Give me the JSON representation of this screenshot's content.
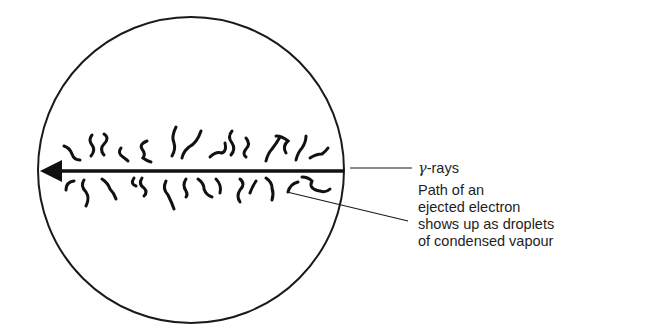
{
  "diagram": {
    "labels": {
      "gamma_symbol": "γ",
      "gamma_text": "-rays",
      "electron_lines": [
        "Path of an",
        "ejected electron",
        "shows up as droplets",
        "of condensed vapour"
      ]
    },
    "elements": {
      "chamber": "circle",
      "beam": "arrow pointing left",
      "tracks": "wavy droplet trails above and below beam"
    },
    "colors": {
      "ink": "#1a1a1a",
      "background": "#ffffff"
    }
  }
}
